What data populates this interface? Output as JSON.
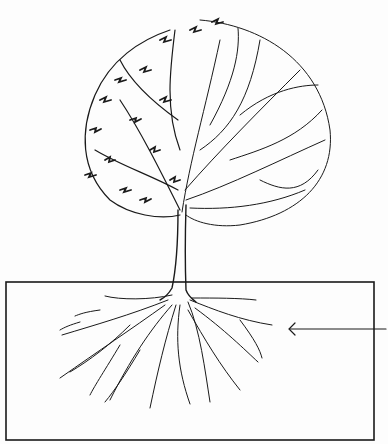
{
  "figure": {
    "colors": {
      "ink": "#1a1a1a",
      "background": "#fdfdfd"
    }
  }
}
